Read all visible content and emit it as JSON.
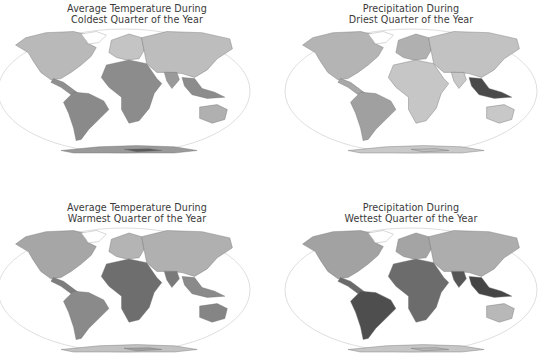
{
  "figure": {
    "panels": [
      {
        "id": "coldest-temp",
        "title_line1": "Average Temperature During",
        "title_line2": "Coldest Quarter of the Year",
        "variable": "Average Temperature During Coldest Quarter of the Year",
        "shading": {
          "north_america": "#b9b9b9",
          "greenland": "#ffffff",
          "central_america": "#8f8f8f",
          "south_america": "#8a8a8a",
          "europe": "#c4c4c4",
          "africa": "#8c8c8c",
          "asia": "#bdbdbd",
          "india": "#9a9a9a",
          "se_asia": "#8c8c8c",
          "australia": "#b0b0b0",
          "antarctica": "#9a9a9a",
          "antarctica_dark": "#5a5a5a"
        }
      },
      {
        "id": "driest-precip",
        "title_line1": "Precipitation During",
        "title_line2": "Driest Quarter of the Year",
        "variable": "Precipitation During Driest Quarter of the Year",
        "shading": {
          "north_america": "#b4b4b4",
          "greenland": "#ffffff",
          "central_america": "#a8a8a8",
          "south_america": "#a0a0a0",
          "europe": "#b0b0b0",
          "africa": "#c6c6c6",
          "asia": "#c2c2c2",
          "india": "#c8c8c8",
          "se_asia": "#4a4a4a",
          "australia": "#c8c8c8",
          "antarctica": "#c9c9c9",
          "antarctica_dark": "#bdbdbd"
        }
      },
      {
        "id": "warmest-temp",
        "title_line1": "Average Temperature During",
        "title_line2": "Warmest Quarter of the Year",
        "variable": "Average Temperature During Warmest Quarter of the Year",
        "shading": {
          "north_america": "#a6a6a6",
          "greenland": "#ffffff",
          "central_america": "#7d7d7d",
          "south_america": "#8a8a8a",
          "europe": "#b4b4b4",
          "africa": "#6e6e6e",
          "asia": "#b0b0b0",
          "india": "#7a7a7a",
          "se_asia": "#8a8a8a",
          "australia": "#858585",
          "antarctica": "#c2c2c2",
          "antarctica_dark": "#a0a0a0"
        }
      },
      {
        "id": "wettest-precip",
        "title_line1": "Precipitation During",
        "title_line2": "Wettest Quarter of the Year",
        "variable": "Precipitation During Wettest Quarter of the Year",
        "shading": {
          "north_america": "#a2a2a2",
          "greenland": "#ffffff",
          "central_america": "#6a6a6a",
          "south_america": "#4e4e4e",
          "europe": "#a4a4a4",
          "africa": "#6c6c6c",
          "asia": "#adadad",
          "india": "#565656",
          "se_asia": "#454545",
          "australia": "#b8b8b8",
          "antarctica": "#c6c6c6",
          "antarctica_dark": "#b6b6b6"
        }
      }
    ],
    "colors": {
      "title_text": "#3a3a3a",
      "ellipse_outline": "#d6d6d6",
      "borders": "#6e6e6e",
      "background": "#ffffff"
    },
    "projection": "Robinson-style world map (grayscale)"
  }
}
